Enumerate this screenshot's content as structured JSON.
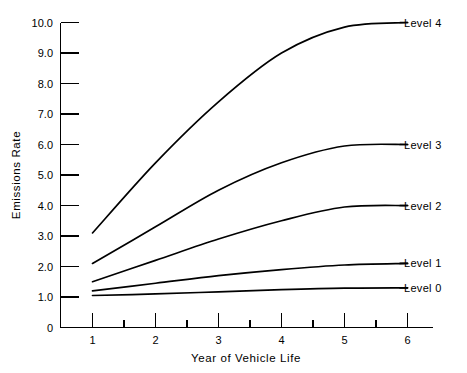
{
  "chart_data": {
    "type": "line",
    "title": "",
    "xlabel": "Year of Vehicle Life",
    "ylabel": "Emissions Rate",
    "xlim": [
      0.5,
      6.5
    ],
    "ylim": [
      0,
      10
    ],
    "grid": false,
    "legend_position": "right-inline-labels",
    "x": [
      1,
      2,
      3,
      4,
      5,
      6
    ],
    "x_ticks": [
      "1",
      "2",
      "3",
      "4",
      "5",
      "6"
    ],
    "x_minor_ticks": [
      1.5,
      2.5,
      3.5,
      4.5,
      5.5
    ],
    "y_ticks": [
      "0",
      "1.0",
      "2.0",
      "3.0",
      "4.0",
      "5.0",
      "6.0",
      "7.0",
      "8.0",
      "9.0",
      "10.0"
    ],
    "series": [
      {
        "name": "Level 4",
        "label": "Level 4",
        "values": [
          3.1,
          5.4,
          7.4,
          9.0,
          9.85,
          10.0
        ]
      },
      {
        "name": "Level 3",
        "label": "Level 3",
        "values": [
          2.1,
          3.3,
          4.5,
          5.4,
          5.95,
          6.0
        ]
      },
      {
        "name": "Level 2",
        "label": "Level 2",
        "values": [
          1.5,
          2.2,
          2.9,
          3.5,
          3.95,
          4.0
        ]
      },
      {
        "name": "Level 1",
        "label": "Level 1",
        "values": [
          1.2,
          1.45,
          1.7,
          1.9,
          2.05,
          2.1
        ]
      },
      {
        "name": "Level 0",
        "label": "Level 0",
        "values": [
          1.05,
          1.1,
          1.17,
          1.24,
          1.29,
          1.3
        ]
      }
    ]
  },
  "axes": {
    "y_title": "Emissions Rate",
    "x_title": "Year of Vehicle Life",
    "y_tick_labels": [
      "10.0",
      "9.0",
      "8.0",
      "7.0",
      "6.0",
      "5.0",
      "4.0",
      "3.0",
      "2.0",
      "1.0",
      "0"
    ],
    "x_tick_labels": [
      "1",
      "2",
      "3",
      "4",
      "5",
      "6"
    ]
  },
  "series_labels": {
    "level4": "Level 4",
    "level3": "Level 3",
    "level2": "Level 2",
    "level1": "Level 1",
    "level0": "Level 0"
  },
  "colors": {
    "ink": "#000000",
    "background": "#ffffff"
  }
}
